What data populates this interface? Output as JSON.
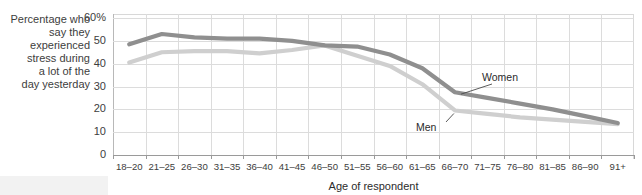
{
  "chart_data": {
    "type": "line",
    "title": "",
    "ylabel": "Percentage who say they experienced stress during a lot of the day yesterday",
    "xlabel": "Age of respondent",
    "categories": [
      "18–20",
      "21–25",
      "26–30",
      "31–35",
      "36–40",
      "41–45",
      "46–50",
      "51–55",
      "56–60",
      "61–65",
      "66–70",
      "71–75",
      "76–80",
      "81–85",
      "86–90",
      "91+"
    ],
    "ylim": [
      0,
      60
    ],
    "yticks": [
      0,
      10,
      20,
      30,
      40,
      50,
      60
    ],
    "ytick_labels": [
      "0",
      "10",
      "20",
      "30",
      "40",
      "50",
      "60%"
    ],
    "grid": true,
    "legend_position": "inline-annotations",
    "series": [
      {
        "name": "Women",
        "color": "#8f8f8f",
        "values": [
          48.5,
          53.0,
          51.5,
          51.0,
          51.0,
          50.0,
          48.0,
          47.5,
          44.0,
          38.0,
          27.5,
          25.0,
          22.5,
          20.0,
          17.0,
          14.0
        ]
      },
      {
        "name": "Men",
        "color": "#cfcfcf",
        "values": [
          40.5,
          45.0,
          45.5,
          45.5,
          44.5,
          46.0,
          48.0,
          43.5,
          39.0,
          31.0,
          19.5,
          18.0,
          16.5,
          15.5,
          14.5,
          13.5
        ]
      }
    ],
    "annotations": [
      {
        "text": "Women",
        "series": "Women"
      },
      {
        "text": "Men",
        "series": "Men"
      }
    ]
  },
  "axis": {
    "y_caption": "Percentage who\nsay they\nexperienced\nstress during\na lot of the\nday yesterday",
    "x_title": "Age of respondent"
  }
}
